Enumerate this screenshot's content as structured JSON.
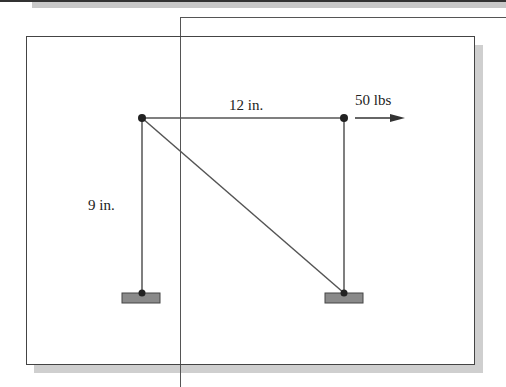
{
  "diagram": {
    "type": "truss-frame",
    "labels": {
      "top_span": "12 in.",
      "height": "9 in.",
      "load": "50 lbs"
    },
    "colors": {
      "members": "#555555",
      "joints": "#222222",
      "supports": "#8a8a8a",
      "shadow": "#cfcfcf"
    }
  }
}
